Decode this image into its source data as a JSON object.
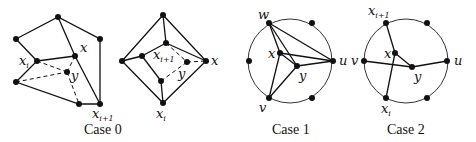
{
  "figure": {
    "panels": [
      {
        "caption": "Case 0",
        "labels": {
          "xi": "x",
          "xi_sub": "i",
          "x": "x",
          "y": "y",
          "xi1": "x",
          "xi1_sub": "i+1"
        }
      },
      {
        "caption": "",
        "labels": {
          "xi1": "x",
          "xi1_sub": "i+1",
          "x": "x",
          "y": "y",
          "xi": "x",
          "xi_sub": "i"
        }
      },
      {
        "caption": "Case 1",
        "labels": {
          "w": "w",
          "x": "x",
          "y": "y",
          "u": "u",
          "v": "v"
        }
      },
      {
        "caption": "Case 2",
        "labels": {
          "xi1": "x",
          "xi1_sub": "i+1",
          "v": "v",
          "x": "x",
          "y": "y",
          "u": "u",
          "xi": "x",
          "xi_sub": "i"
        }
      }
    ]
  }
}
